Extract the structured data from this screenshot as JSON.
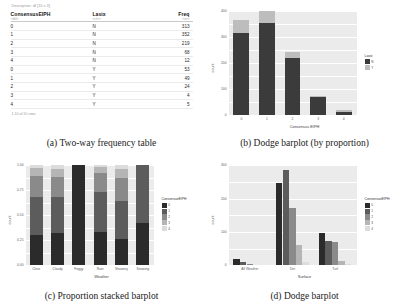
{
  "figure": {
    "panels": [
      {
        "caption": "(a) Two-way frequency table"
      },
      {
        "caption": "(b) Dodge barplot (by proportion)"
      },
      {
        "caption": "(c) Proportion stacked barplot"
      },
      {
        "caption": "(d) Dodge barplot"
      }
    ]
  },
  "table": {
    "dimensions": "Description: df [10 x 3]",
    "columns": [
      {
        "label": "ConsensusEIPH",
        "sub": "<dbl>"
      },
      {
        "label": "Lasix",
        "sub": "<chr>"
      },
      {
        "label": "Freq",
        "sub": "<int>"
      }
    ],
    "rows": [
      {
        "eiph": "0",
        "lasix": "N",
        "freq": "313"
      },
      {
        "eiph": "1",
        "lasix": "N",
        "freq": "352"
      },
      {
        "eiph": "2",
        "lasix": "N",
        "freq": "219"
      },
      {
        "eiph": "3",
        "lasix": "N",
        "freq": "68"
      },
      {
        "eiph": "4",
        "lasix": "N",
        "freq": "12"
      },
      {
        "eiph": "0",
        "lasix": "Y",
        "freq": "53"
      },
      {
        "eiph": "1",
        "lasix": "Y",
        "freq": "49"
      },
      {
        "eiph": "2",
        "lasix": "Y",
        "freq": "24"
      },
      {
        "eiph": "3",
        "lasix": "Y",
        "freq": "4"
      },
      {
        "eiph": "4",
        "lasix": "Y",
        "freq": "5"
      }
    ],
    "footer": "1-10 of 10 rows"
  },
  "colors": {
    "panel_bg": "#ebebeb",
    "grid": "#ffffff",
    "lasix_n": "#3b3b3b",
    "lasix_y": "#bdbdbd",
    "eiph_0": "#2b2b2b",
    "eiph_1": "#5c5c5c",
    "eiph_2": "#8a8a8a",
    "eiph_3": "#b5b5b5",
    "eiph_4": "#dcdcdc"
  },
  "chart_data": [
    {
      "id": "b",
      "type": "bar",
      "subtype": "stacked",
      "title": "",
      "xlabel": "Consensus EIPH",
      "ylabel": "count",
      "categories": [
        "0",
        "1",
        "2",
        "3",
        "4"
      ],
      "ylim": [
        0,
        400
      ],
      "yticks": [
        "0",
        "100",
        "200",
        "300",
        "400"
      ],
      "grid": true,
      "legend": {
        "title": "Lasix",
        "position": "right",
        "entries": [
          {
            "label": "N",
            "color": "#3b3b3b"
          },
          {
            "label": "Y",
            "color": "#bdbdbd"
          }
        ]
      },
      "series": [
        {
          "name": "N",
          "values": [
            313,
            352,
            219,
            68,
            12
          ]
        },
        {
          "name": "Y",
          "values": [
            53,
            49,
            24,
            4,
            5
          ]
        }
      ],
      "totals": [
        366,
        401,
        243,
        72,
        17
      ]
    },
    {
      "id": "c",
      "type": "bar",
      "subtype": "proportion-stacked",
      "title": "",
      "xlabel": "Weather",
      "ylabel": "count",
      "categories": [
        "Clear",
        "Cloudy",
        "Foggy",
        "Rain",
        "Showery",
        "Snowing"
      ],
      "ylim": [
        0,
        1
      ],
      "yticks": [
        "0.00",
        "0.25",
        "0.50",
        "0.75",
        "1.00"
      ],
      "grid": true,
      "legend": {
        "title": "ConsensusEIPH",
        "position": "right",
        "entries": [
          {
            "label": "0",
            "color": "#2b2b2b"
          },
          {
            "label": "1",
            "color": "#5c5c5c"
          },
          {
            "label": "2",
            "color": "#8a8a8a"
          },
          {
            "label": "3",
            "color": "#b5b5b5"
          },
          {
            "label": "4",
            "color": "#dcdcdc"
          }
        ]
      },
      "series": [
        {
          "name": "0",
          "values": [
            0.3,
            0.32,
            1.0,
            0.33,
            0.26,
            0.42
          ]
        },
        {
          "name": "1",
          "values": [
            0.38,
            0.36,
            0.0,
            0.4,
            0.38,
            0.58
          ]
        },
        {
          "name": "2",
          "values": [
            0.21,
            0.2,
            0.0,
            0.19,
            0.23,
            0.0
          ]
        },
        {
          "name": "3",
          "values": [
            0.08,
            0.08,
            0.0,
            0.06,
            0.09,
            0.0
          ]
        },
        {
          "name": "4",
          "values": [
            0.03,
            0.04,
            0.0,
            0.02,
            0.04,
            0.0
          ]
        }
      ]
    },
    {
      "id": "d",
      "type": "bar",
      "subtype": "dodge",
      "title": "",
      "xlabel": "Surface",
      "ylabel": "count",
      "categories": [
        "All Weather",
        "Dirt",
        "Turf"
      ],
      "ylim": [
        0,
        300
      ],
      "yticks": [
        "0",
        "100",
        "200",
        "300"
      ],
      "grid": true,
      "legend": {
        "title": "ConsensusEIPH",
        "position": "right",
        "entries": [
          {
            "label": "0",
            "color": "#2b2b2b"
          },
          {
            "label": "1",
            "color": "#5c5c5c"
          },
          {
            "label": "2",
            "color": "#8a8a8a"
          },
          {
            "label": "3",
            "color": "#b5b5b5"
          },
          {
            "label": "4",
            "color": "#dcdcdc"
          }
        ]
      },
      "series": [
        {
          "name": "0",
          "values": [
            18,
            248,
            98
          ]
        },
        {
          "name": "1",
          "values": [
            9,
            285,
            72
          ]
        },
        {
          "name": "2",
          "values": [
            3,
            172,
            70
          ]
        },
        {
          "name": "3",
          "values": [
            1,
            60,
            14
          ]
        },
        {
          "name": "4",
          "values": [
            0,
            11,
            4
          ]
        }
      ]
    }
  ]
}
